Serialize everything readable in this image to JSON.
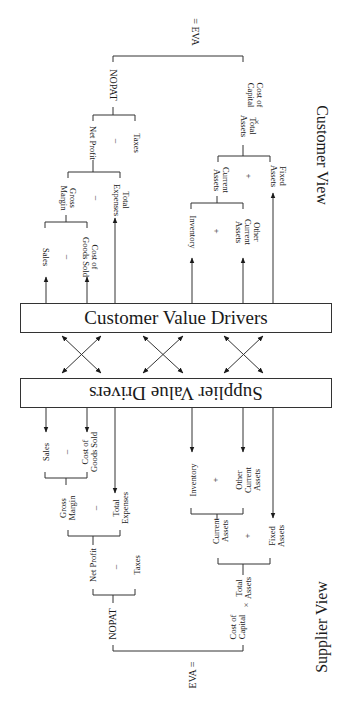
{
  "customer_view": {
    "title": "Customer View",
    "box_label": "Customer Value Drivers",
    "eva": "= EVA",
    "nopat": "NOPAT",
    "net_profit": "Net Profit",
    "taxes": "Taxes",
    "gross_margin": "Gross\nMargin",
    "total_expenses": "Total\nExpenses",
    "sales": "Sales",
    "cogs": "Cost of\nGoods Sold",
    "total_assets": "Total\nAssets",
    "cost_of_capital": "Cost of\nCapital",
    "current_assets": "Current\nAssets",
    "fixed_assets": "Fixed\nAssets",
    "inventory": "Inventory",
    "other_current_assets": "Other\nCurrent\nAssets",
    "op_minus": "–",
    "op_plus": "+",
    "op_times": "×"
  },
  "supplier_view": {
    "title": "Supplier View",
    "box_label": "Supplier Value Drivers",
    "eva": "EVA =",
    "nopat": "NOPAT",
    "net_profit": "Net Profit",
    "taxes": "Taxes",
    "gross_margin": "Gross\nMargin",
    "total_expenses": "Total\nExpenses",
    "sales": "Sales",
    "cogs": "Cost of\nGoods Sold",
    "total_assets": "Total\nAssets",
    "cost_of_capital": "Cost of\nCapital",
    "current_assets": "Current\nAssets",
    "fixed_assets": "Fixed\nAssets",
    "inventory": "Inventory",
    "other_current_assets": "Other\nCurrent\nAssets",
    "op_minus": "–",
    "op_plus": "+",
    "op_times": "×"
  }
}
